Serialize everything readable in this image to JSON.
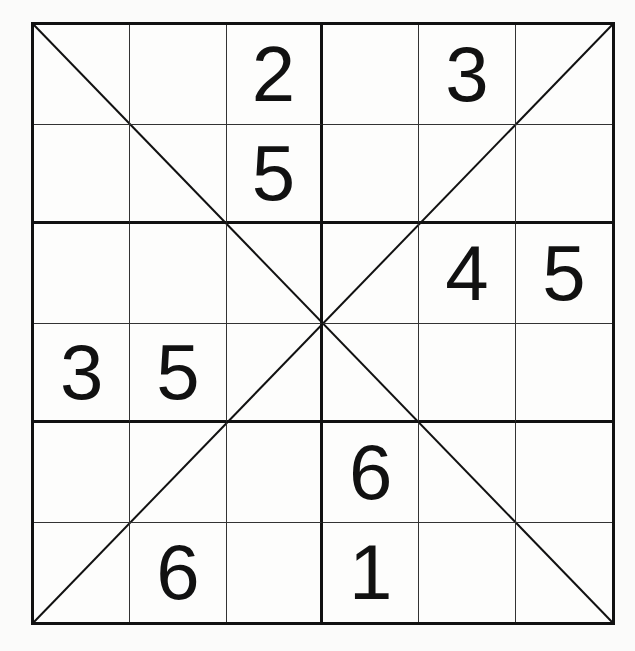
{
  "puzzle": {
    "type": "diagonal-sudoku-6x6",
    "size": 6,
    "box_rows": 2,
    "box_cols": 3,
    "has_diagonals": true,
    "colors": {
      "line": "#111111",
      "digit": "#111111",
      "background": "#fdfdfc"
    },
    "rows": [
      [
        "",
        "",
        "2",
        "",
        "3",
        ""
      ],
      [
        "",
        "",
        "5",
        "",
        "",
        ""
      ],
      [
        "",
        "",
        "",
        "",
        "4",
        "5"
      ],
      [
        "3",
        "5",
        "",
        "",
        "",
        ""
      ],
      [
        "",
        "",
        "",
        "6",
        "",
        ""
      ],
      [
        "",
        "6",
        "",
        "1",
        "",
        ""
      ]
    ]
  }
}
